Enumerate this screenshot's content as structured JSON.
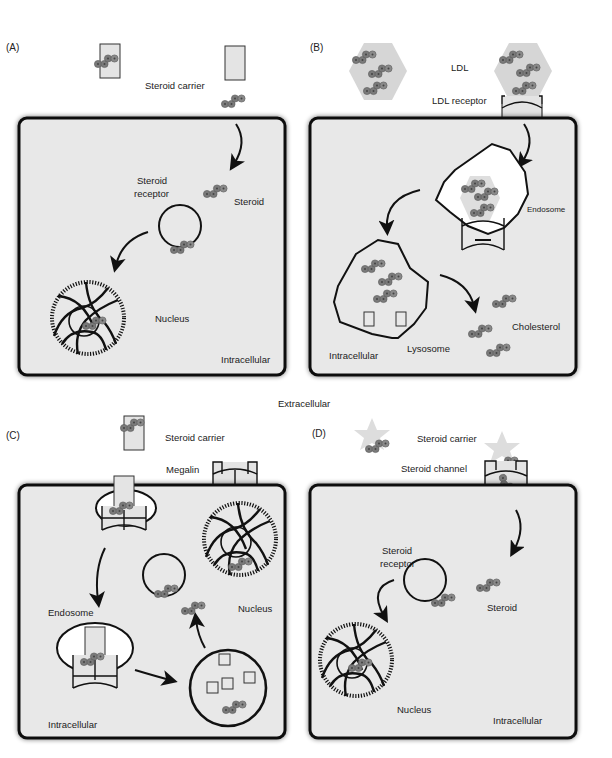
{
  "figure": {
    "center_label": "Extracellular",
    "colors": {
      "cell_fill": "#e8e8e8",
      "cell_border": "#111111",
      "steroid_molecule": "#7a7a7a",
      "ldl_particle": "#d6d6d6",
      "endosome_fill": "#ffffff",
      "background": "#ffffff"
    },
    "panels": [
      {
        "id": "A",
        "tag": "(A)",
        "labels": {
          "carrier": "Steroid carrier",
          "receptor_line1": "Steroid",
          "receptor_line2": "receptor",
          "steroid": "Steroid",
          "nucleus": "Nucleus",
          "region": "Intracellular"
        }
      },
      {
        "id": "B",
        "tag": "(B)",
        "labels": {
          "ldl": "LDL",
          "ldl_receptor": "LDL receptor",
          "endosome": "Endosome",
          "lysosome": "Lysosome",
          "cholesterol": "Cholesterol",
          "region": "Intracellular"
        }
      },
      {
        "id": "C",
        "tag": "(C)",
        "labels": {
          "carrier": "Steroid carrier",
          "megalin": "Megalin",
          "endosome": "Endosome",
          "nucleus": "Nucleus",
          "region": "Intracellular"
        }
      },
      {
        "id": "D",
        "tag": "(D)",
        "labels": {
          "carrier": "Steroid carrier",
          "channel": "Steroid channel",
          "receptor_line1": "Steroid",
          "receptor_line2": "receptor",
          "steroid": "Steroid",
          "nucleus": "Nucleus",
          "region": "Intracellular"
        }
      }
    ]
  }
}
